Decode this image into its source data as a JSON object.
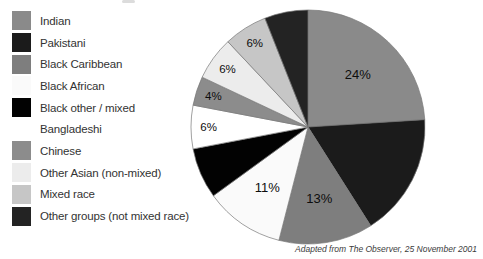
{
  "chart_data": {
    "type": "pie",
    "direction": "clockwise",
    "start_angle_deg": 0,
    "legend_position": "left",
    "slices": [
      {
        "label": "Indian",
        "value": 24,
        "value_label": "24%",
        "label_shown": true,
        "color": "#8a8a8a"
      },
      {
        "label": "Pakistani",
        "value": 17,
        "value_label": "",
        "label_shown": false,
        "color": "#1b1b1b"
      },
      {
        "label": "Black Caribbean",
        "value": 13,
        "value_label": "13%",
        "label_shown": true,
        "color": "#7e7e7e"
      },
      {
        "label": "Black African",
        "value": 11,
        "value_label": "11%",
        "label_shown": true,
        "color": "#fafafa"
      },
      {
        "label": "Black other / mixed",
        "value": 7,
        "value_label": "",
        "label_shown": false,
        "color": "#020202"
      },
      {
        "label": "Bangladeshi",
        "value": 6,
        "value_label": "6%",
        "label_shown": true,
        "color": "#ffffff"
      },
      {
        "label": "Chinese",
        "value": 4,
        "value_label": "4%",
        "label_shown": true,
        "color": "#8c8c8c"
      },
      {
        "label": "Other Asian (non-mixed)",
        "value": 6,
        "value_label": "6%",
        "label_shown": true,
        "color": "#ececec"
      },
      {
        "label": "Mixed race",
        "value": 6,
        "value_label": "6%",
        "label_shown": true,
        "color": "#c6c6c6"
      },
      {
        "label": "Other groups (not mixed race)",
        "value": 6,
        "value_label": "",
        "label_shown": false,
        "color": "#232323"
      }
    ],
    "slice_outline_color": "#787878",
    "source_note": "Adapted from The Observer, 25 November 2001"
  }
}
